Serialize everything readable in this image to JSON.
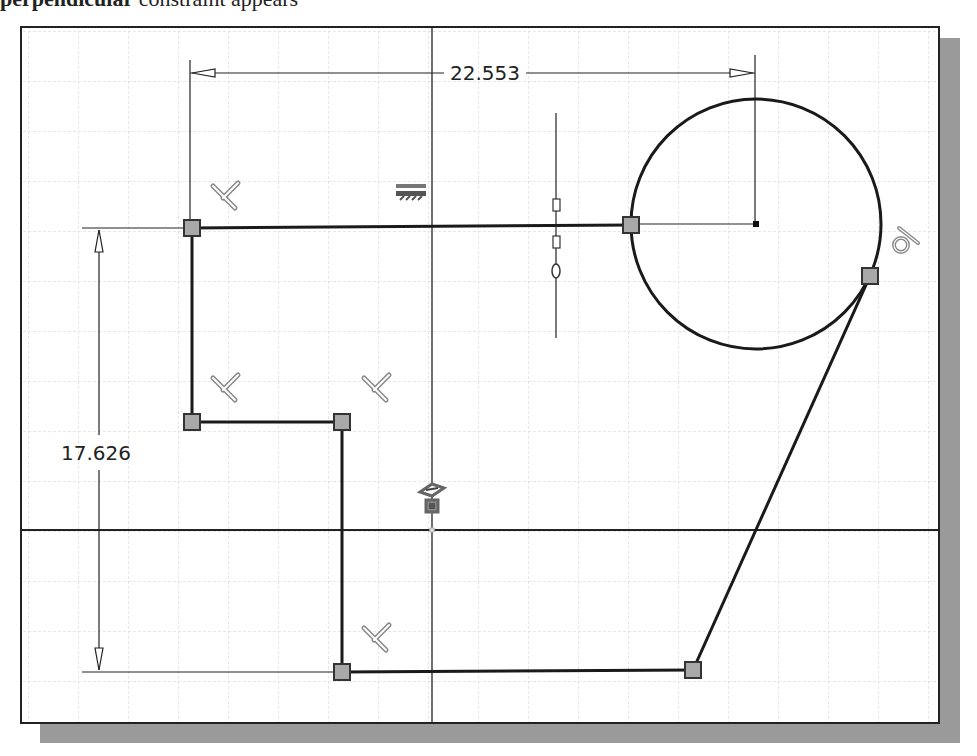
{
  "caption": {
    "bold_text": "perpendicular",
    "rest_text": "constraint appears"
  },
  "canvas": {
    "background": "#ffffff",
    "grid_color": "#c8c8c8",
    "grid_spacing_px": 50,
    "line_color": "#222222",
    "point_fill": "#a8a8a8"
  },
  "dimensions": {
    "horizontal": {
      "value": "22.553"
    },
    "vertical": {
      "value": "17.626"
    }
  },
  "constraints": [
    {
      "type": "perpendicular",
      "location": "top-left corner"
    },
    {
      "type": "perpendicular",
      "location": "middle-left corner"
    },
    {
      "type": "perpendicular",
      "location": "middle step corner"
    },
    {
      "type": "perpendicular",
      "location": "bottom corner"
    },
    {
      "type": "horizontal",
      "location": "top line"
    },
    {
      "type": "tangent",
      "location": "circle-line tangency"
    },
    {
      "type": "coincident/fix",
      "location": "origin"
    },
    {
      "type": "vertical-alignment",
      "location": "top line midpoint"
    }
  ],
  "labels": {
    "vertical_constraint_glyph": "0"
  }
}
